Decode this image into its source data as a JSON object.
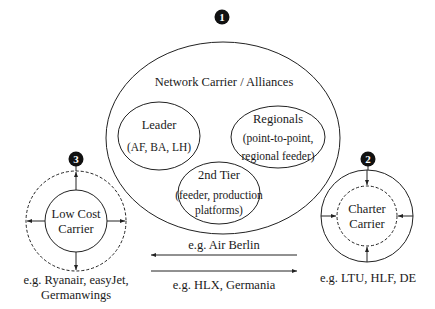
{
  "badges": {
    "one": "1",
    "two": "2",
    "three": "3"
  },
  "network": {
    "title": "Network Carrier / Alliances",
    "leader": {
      "title": "Leader",
      "desc": "(AF, BA, LH)"
    },
    "regionals": {
      "title": "Regionals",
      "desc_line1": "(point-to-point,",
      "desc_line2": "regional feeder)"
    },
    "second_tier": {
      "title": "2nd Tier",
      "desc_line1": "(feeder, production",
      "desc_line2": "platforms)"
    }
  },
  "low_cost": {
    "line1": "Low Cost",
    "line2": "Carrier",
    "example_line1": "e.g. Ryanair, easyJet,",
    "example_line2": "Germanwings"
  },
  "charter": {
    "line1": "Charter",
    "line2": "Carrier",
    "example": "e.g. LTU, HLF, DE"
  },
  "arrows": {
    "left_label": "e.g. Air Berlin",
    "right_label": "e.g. HLX, Germania"
  }
}
